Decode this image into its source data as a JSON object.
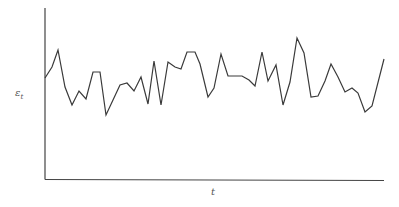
{
  "chart_data": {
    "type": "line",
    "title": "",
    "xlabel": "t",
    "ylabel": "ε",
    "ylabel_subscript": "t",
    "grid": false,
    "legend": null,
    "ticks": {
      "x": [],
      "y": []
    },
    "axes_px": {
      "x0": 45,
      "x1": 384,
      "y_top": 8,
      "y_bottom": 179
    },
    "series": [
      {
        "name": "epsilon_t",
        "color": "#3a3a3a",
        "points_px": [
          [
            45,
            78
          ],
          [
            52,
            67
          ],
          [
            58,
            50
          ],
          [
            65,
            87
          ],
          [
            72,
            105
          ],
          [
            79,
            91
          ],
          [
            86,
            99
          ],
          [
            93,
            72
          ],
          [
            100,
            72
          ],
          [
            106,
            115
          ],
          [
            113,
            100
          ],
          [
            120,
            85
          ],
          [
            127,
            83
          ],
          [
            134,
            91
          ],
          [
            141,
            77
          ],
          [
            148,
            104
          ],
          [
            154,
            61
          ],
          [
            161,
            105
          ],
          [
            168,
            62
          ],
          [
            175,
            67
          ],
          [
            181,
            69
          ],
          [
            187,
            52
          ],
          [
            195,
            52
          ],
          [
            200,
            64
          ],
          [
            208,
            97
          ],
          [
            214,
            88
          ],
          [
            221,
            54
          ],
          [
            228,
            76
          ],
          [
            235,
            76
          ],
          [
            242,
            76
          ],
          [
            249,
            80
          ],
          [
            255,
            86
          ],
          [
            262,
            52
          ],
          [
            268,
            81
          ],
          [
            276,
            65
          ],
          [
            283,
            105
          ],
          [
            290,
            82
          ],
          [
            297,
            38
          ],
          [
            304,
            53
          ],
          [
            311,
            97
          ],
          [
            318,
            96
          ],
          [
            325,
            81
          ],
          [
            331,
            64
          ],
          [
            338,
            77
          ],
          [
            345,
            92
          ],
          [
            352,
            88
          ],
          [
            358,
            93
          ],
          [
            365,
            112
          ],
          [
            372,
            106
          ],
          [
            384,
            59
          ]
        ]
      }
    ]
  },
  "labels": {
    "y_main": "ε",
    "y_sub": "t",
    "x": "t"
  }
}
